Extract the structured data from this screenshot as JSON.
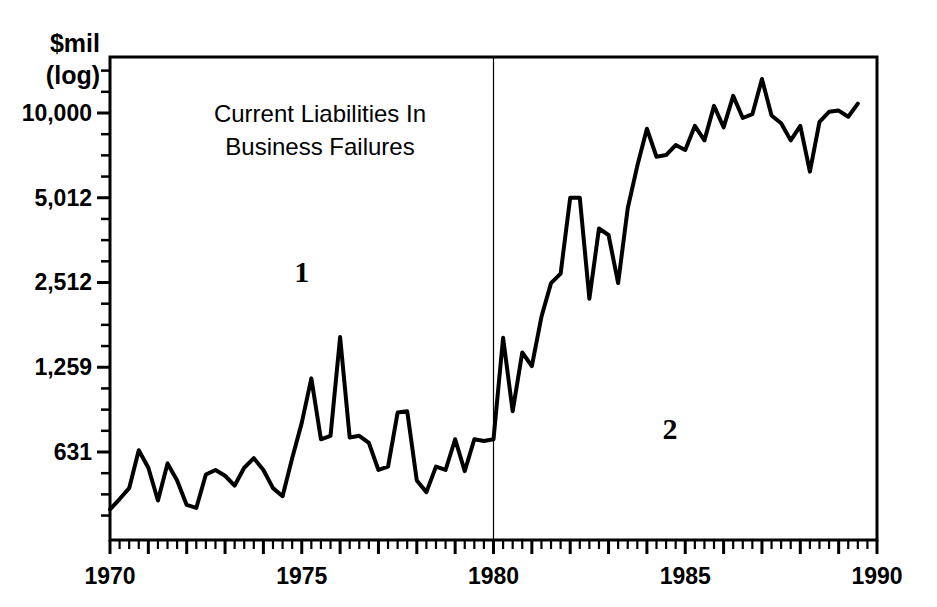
{
  "chart_data": {
    "type": "line",
    "title": "Current Liabilities In Business Failures",
    "title_lines": [
      "Current Liabilities In",
      "Business Failures"
    ],
    "xlabel": "",
    "ylabel": "$mil (log)",
    "ylabel_lines": [
      "$mil",
      "(log)"
    ],
    "yscale": "log",
    "ylim": [
      390,
      14200
    ],
    "xlim": [
      1970,
      1990
    ],
    "grid": false,
    "legend": null,
    "ytick_labels": [
      "10,000",
      "5,012",
      "2,512",
      "1,259",
      "631"
    ],
    "ytick_values": [
      10000,
      5012,
      2512,
      1259,
      631
    ],
    "yminor_count_between": 3,
    "xtick_labels": [
      "1970",
      "1975",
      "1980",
      "1985",
      "1990"
    ],
    "xtick_values": [
      1970,
      1975,
      1980,
      1985,
      1990
    ],
    "xminor_step": 0.25,
    "line_color": "#000000",
    "line_width": 4,
    "annotations": [
      {
        "text": "1",
        "x": 1975.0,
        "y": 2512,
        "name": "region-label-1"
      },
      {
        "text": "2",
        "x": 1984.6,
        "y": 700,
        "name": "region-label-2"
      }
    ],
    "vertical_divider": {
      "x": 1980,
      "color": "#000000",
      "width": 1.2
    },
    "x": [
      1970.0,
      1970.25,
      1970.5,
      1970.75,
      1971.0,
      1971.25,
      1971.5,
      1971.75,
      1972.0,
      1972.25,
      1972.5,
      1972.75,
      1973.0,
      1973.25,
      1973.5,
      1973.75,
      1974.0,
      1974.25,
      1974.5,
      1974.75,
      1975.0,
      1975.25,
      1975.5,
      1975.75,
      1976.0,
      1976.25,
      1976.5,
      1976.75,
      1977.0,
      1977.25,
      1977.5,
      1977.75,
      1978.0,
      1978.25,
      1978.5,
      1978.75,
      1979.0,
      1979.25,
      1979.5,
      1979.75,
      1980.0,
      1980.25,
      1980.5,
      1980.75,
      1981.0,
      1981.25,
      1981.5,
      1981.75,
      1982.0,
      1982.25,
      1982.5,
      1982.75,
      1983.0,
      1983.25,
      1983.5,
      1983.75,
      1984.0,
      1984.25,
      1984.5,
      1984.75,
      1985.0,
      1985.25,
      1985.5,
      1985.75,
      1986.0,
      1986.25,
      1986.5,
      1986.75,
      1987.0,
      1987.25,
      1987.5,
      1987.75,
      1988.0,
      1988.25,
      1988.5,
      1988.75,
      1989.0,
      1989.25,
      1989.5
    ],
    "values": [
      395,
      430,
      470,
      640,
      555,
      425,
      575,
      500,
      410,
      400,
      525,
      545,
      520,
      480,
      555,
      600,
      545,
      470,
      440,
      600,
      800,
      1150,
      700,
      720,
      1610,
      710,
      720,
      680,
      545,
      560,
      870,
      880,
      500,
      455,
      560,
      545,
      700,
      540,
      700,
      690,
      700,
      1600,
      880,
      1420,
      1270,
      1900,
      2500,
      2700,
      5012,
      5012,
      2200,
      3900,
      3700,
      2500,
      4600,
      6500,
      8800,
      7000,
      7100,
      7700,
      7400,
      9000,
      8000,
      10600,
      8900,
      11500,
      9600,
      9900,
      13200,
      9800,
      9200,
      8000,
      9000,
      6200,
      9300,
      10100,
      10200,
      9700,
      10800
    ]
  },
  "ylabel_block": {
    "line1": "$mil",
    "line2": "(log)"
  }
}
